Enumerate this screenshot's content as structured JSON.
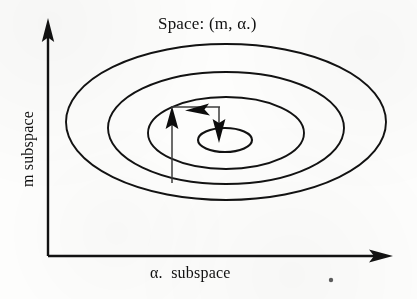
{
  "figure": {
    "title": "Space: (m, α.)",
    "x_axis_label": "α.  subspace",
    "y_axis_label": "m subspace",
    "line_color": "#121212",
    "background_color": "#fdfdfc"
  },
  "chart_data": {
    "type": "line",
    "title": "Space: (m, α.)",
    "xlabel": "α.  subspace",
    "ylabel": "m subspace",
    "grid": false,
    "legend": null,
    "axes": {
      "origin": [
        48,
        256
      ],
      "x_axis_tip": [
        392,
        256
      ],
      "y_axis_tip": [
        48,
        20
      ],
      "arrowheads": [
        "x-axis-right",
        "y-axis-up"
      ]
    },
    "contours": [
      {
        "name": "contour-1-outer",
        "cx": 226,
        "cy": 122,
        "rx": 160,
        "ry": 78
      },
      {
        "name": "contour-2",
        "cx": 226,
        "cy": 128,
        "rx": 118,
        "ry": 56
      },
      {
        "name": "contour-3",
        "cx": 226,
        "cy": 133,
        "rx": 78,
        "ry": 36
      },
      {
        "name": "contour-4-inner",
        "cx": 225,
        "cy": 140,
        "rx": 27,
        "ry": 12
      }
    ],
    "path_arrows": [
      {
        "name": "arrow-up",
        "from": [
          172,
          182
        ],
        "to": [
          172,
          110
        ],
        "direction": "up"
      },
      {
        "name": "arrow-left",
        "from": [
          219,
          108
        ],
        "to": [
          186,
          108
        ],
        "direction": "left"
      },
      {
        "name": "arrow-down",
        "from": [
          219,
          108
        ],
        "to": [
          219,
          140
        ],
        "direction": "down"
      }
    ],
    "artifacts": [
      {
        "name": "scan-speck",
        "cx": 331,
        "cy": 280,
        "r": 2.2
      }
    ]
  }
}
